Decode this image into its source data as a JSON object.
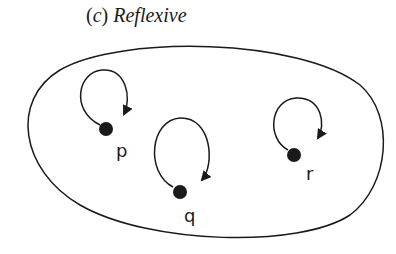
{
  "title": {
    "open_paren": "(",
    "letter": "c",
    "close_paren": ")",
    "name": "Reflexive"
  },
  "diagram": {
    "type": "relation-digraph",
    "relation": "reflexive",
    "set_boundary": "ellipse",
    "nodes": [
      {
        "id": "p",
        "label": "p",
        "self_loop": true
      },
      {
        "id": "q",
        "label": "q",
        "self_loop": true
      },
      {
        "id": "r",
        "label": "r",
        "self_loop": true
      }
    ],
    "colors": {
      "stroke": "#1a1a1a",
      "background": "#ffffff"
    }
  }
}
